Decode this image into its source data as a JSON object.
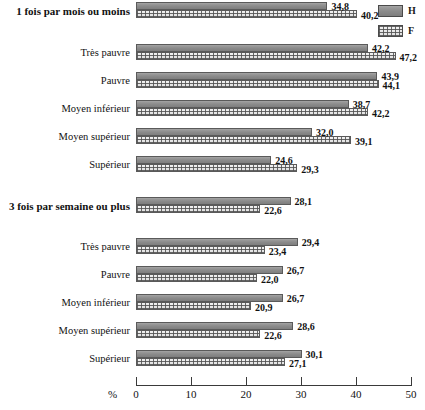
{
  "legend": {
    "items": [
      {
        "key": "H",
        "label": "H",
        "swatch": "solid-gray-swatch-icon",
        "color": "#8d8d8d"
      },
      {
        "key": "F",
        "label": "F",
        "swatch": "hatched-swatch-icon",
        "color": "#e9e9e9"
      }
    ]
  },
  "axis": {
    "unit_label": "%",
    "ticks": [
      0,
      10,
      20,
      30,
      40,
      50
    ],
    "tick_labels": [
      "0",
      "10",
      "20",
      "30",
      "40",
      "50"
    ],
    "min": 0,
    "max": 50
  },
  "chart_data": {
    "type": "bar",
    "orientation": "horizontal",
    "title": "",
    "xlabel": "%",
    "ylabel": "",
    "xlim": [
      0,
      50
    ],
    "grid": false,
    "legend_position": "top-right",
    "series": [
      {
        "name": "H",
        "color": "#8d8d8d",
        "pattern": "solid"
      },
      {
        "name": "F",
        "color": "#e9e9e9",
        "pattern": "cross-hatch"
      }
    ],
    "groups": [
      {
        "heading": "1 fois par mois ou moins",
        "categories": [
          {
            "label": "1 fois par mois ou moins",
            "is_heading": true,
            "H": 34.8,
            "F": 40.2,
            "H_text": "34,8",
            "F_text": "40,2"
          },
          {
            "label": "Très pauvre",
            "is_heading": false,
            "H": 42.2,
            "F": 47.2,
            "H_text": "42,2",
            "F_text": "47,2"
          },
          {
            "label": "Pauvre",
            "is_heading": false,
            "H": 43.9,
            "F": 44.1,
            "H_text": "43,9",
            "F_text": "44,1"
          },
          {
            "label": "Moyen inférieur",
            "is_heading": false,
            "H": 38.7,
            "F": 42.2,
            "H_text": "38,7",
            "F_text": "42,2"
          },
          {
            "label": "Moyen supérieur",
            "is_heading": false,
            "H": 32.0,
            "F": 39.1,
            "H_text": "32,0",
            "F_text": "39,1"
          },
          {
            "label": "Supérieur",
            "is_heading": false,
            "H": 24.6,
            "F": 29.3,
            "H_text": "24,6",
            "F_text": "29,3"
          }
        ]
      },
      {
        "heading": "3 fois par semaine ou plus",
        "categories": [
          {
            "label": "3 fois par semaine ou plus",
            "is_heading": true,
            "H": 28.1,
            "F": 22.6,
            "H_text": "28,1",
            "F_text": "22,6"
          },
          {
            "label": "Très pauvre",
            "is_heading": false,
            "H": 29.4,
            "F": 23.4,
            "H_text": "29,4",
            "F_text": "23,4"
          },
          {
            "label": "Pauvre",
            "is_heading": false,
            "H": 26.7,
            "F": 22.0,
            "H_text": "26,7",
            "F_text": "22,0"
          },
          {
            "label": "Moyen inférieur",
            "is_heading": false,
            "H": 26.7,
            "F": 20.9,
            "H_text": "26,7",
            "F_text": "20,9"
          },
          {
            "label": "Moyen supérieur",
            "is_heading": false,
            "H": 28.6,
            "F": 22.6,
            "H_text": "28,6",
            "F_text": "22,6"
          },
          {
            "label": "Supérieur",
            "is_heading": false,
            "H": 30.1,
            "F": 27.1,
            "H_text": "30,1",
            "F_text": "27,1"
          }
        ]
      }
    ]
  },
  "layout": {
    "plot_left_px": 136,
    "px_per_unit": 5.5,
    "group_tops": [
      2,
      197
    ],
    "row_offsets_group1": [
      0,
      42,
      70,
      98,
      126,
      154
    ],
    "row_offsets_group2": [
      0,
      41,
      69,
      97,
      125,
      153
    ]
  }
}
